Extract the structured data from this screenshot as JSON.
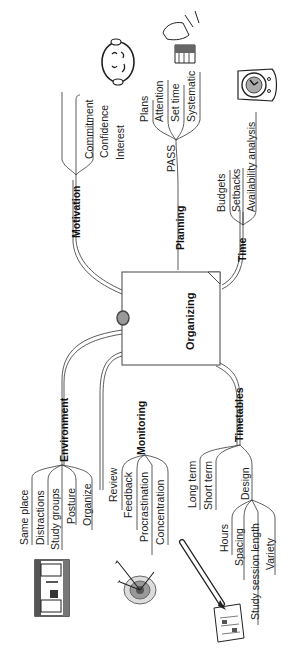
{
  "center": {
    "label": "Organizing"
  },
  "branches": {
    "motivation": {
      "label": "Motivation",
      "items": [
        "Commitment",
        "Confidence",
        "Interest"
      ]
    },
    "planning": {
      "label": "Planning",
      "sub_label": "PASS",
      "items": [
        "Plans",
        "Attention",
        "Set time",
        "Systematic"
      ]
    },
    "time": {
      "label": "Time",
      "items": [
        "Budgets",
        "Setbacks",
        "Availability analysis"
      ]
    },
    "environment": {
      "label": "Environment",
      "items": [
        "Same place",
        "Distractions",
        "Study groups",
        "Posture",
        "Organize"
      ]
    },
    "monitoring": {
      "label": "Monitoring",
      "items": [
        "Review",
        "Feedback",
        "Procrastination",
        "Concentration"
      ]
    },
    "timetables": {
      "label": "Timetables",
      "items": [
        "Long term",
        "Short term"
      ],
      "design": {
        "label": "Design",
        "items": [
          "Hours",
          "Spacing",
          "Study session length",
          "Variety"
        ]
      }
    }
  },
  "illustrations": [
    "thinking-face-icon",
    "hand-writing-icon",
    "clock-icon",
    "study-desk-icon",
    "target-arrows-icon",
    "pencil-calendar-icon"
  ]
}
